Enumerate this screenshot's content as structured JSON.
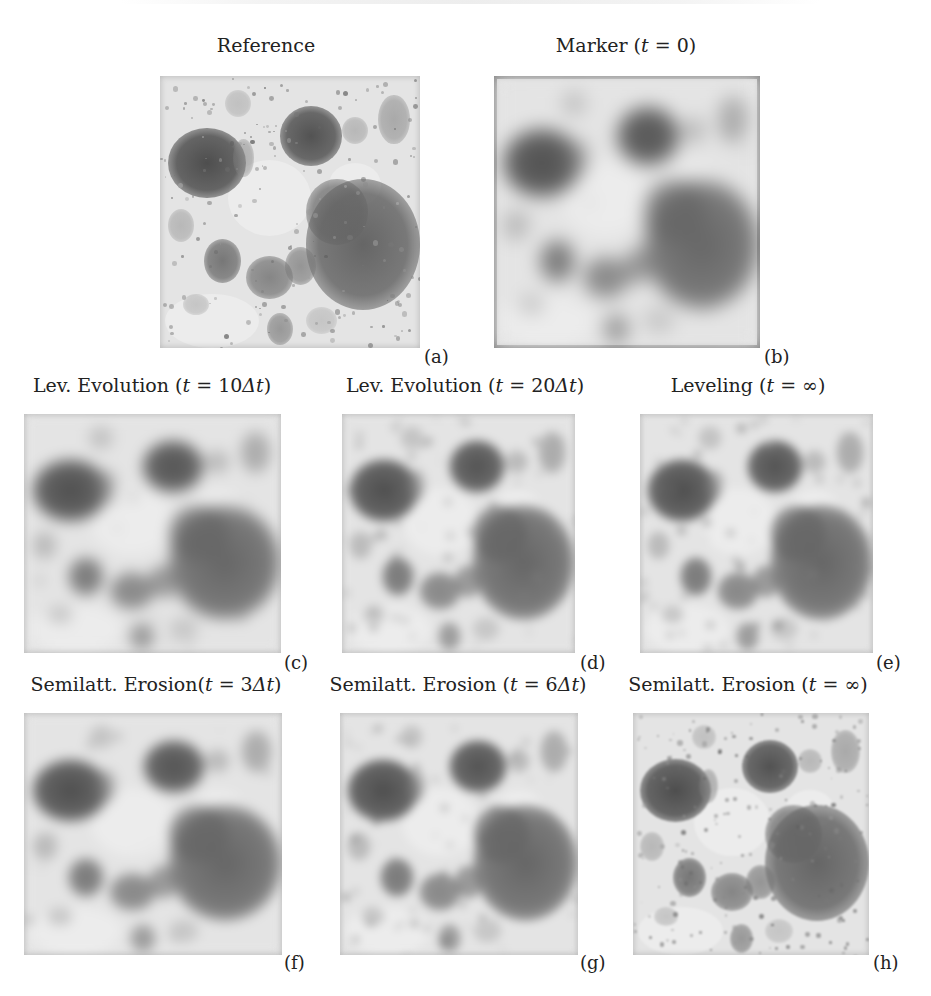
{
  "figure": {
    "panels": [
      {
        "id": "a",
        "title": "Reference",
        "label": "(a)",
        "x": 160,
        "y": 76,
        "w": 260,
        "h": 272,
        "blur": 0,
        "detail": "fine",
        "frame": false
      },
      {
        "id": "b",
        "title_parts": [
          "Marker (",
          "t",
          " = 0)"
        ],
        "title": "Marker (t = 0)",
        "label": "(b)",
        "x": 494,
        "y": 76,
        "w": 266,
        "h": 272,
        "blur": 9,
        "detail": "smooth",
        "frame": true
      },
      {
        "id": "c",
        "title": "Lev. Evolution (t = 10Δt)",
        "label": "(c)",
        "x": 24,
        "y": 414,
        "w": 257,
        "h": 239,
        "blur": 7,
        "detail": "smooth",
        "frame": false
      },
      {
        "id": "d",
        "title": "Lev. Evolution (t = 20Δt)",
        "label": "(d)",
        "x": 342,
        "y": 414,
        "w": 233,
        "h": 239,
        "blur": 5,
        "detail": "medium",
        "frame": false
      },
      {
        "id": "e",
        "title": "Leveling (t = ∞)",
        "label": "(e)",
        "x": 640,
        "y": 414,
        "w": 233,
        "h": 239,
        "blur": 4,
        "detail": "medium",
        "frame": false
      },
      {
        "id": "f",
        "title": "Semilatt. Erosion(t = 3Δt)",
        "label": "(f)",
        "x": 24,
        "y": 713,
        "w": 258,
        "h": 242,
        "blur": 6,
        "detail": "smooth",
        "frame": false
      },
      {
        "id": "g",
        "title": "Semilatt. Erosion (t = 6Δt)",
        "label": "(g)",
        "x": 340,
        "y": 713,
        "w": 238,
        "h": 242,
        "blur": 4,
        "detail": "medium",
        "frame": false
      },
      {
        "id": "h",
        "title": "Semilatt. Erosion (t = ∞)",
        "label": "(h)",
        "x": 633,
        "y": 713,
        "w": 236,
        "h": 242,
        "blur": 1,
        "detail": "fine",
        "frame": false
      }
    ],
    "titles": {
      "a": "Reference",
      "b": "Marker (t = 0)",
      "c": "Lev. Evolution (t = 10Δt)",
      "d": "Lev. Evolution (t = 20Δt)",
      "e": "Leveling (t = ∞)",
      "f": "Semilatt. Erosion(t = 3Δt)",
      "g": "Semilatt. Erosion (t = 6Δt)",
      "h": "Semilatt. Erosion (t = ∞)"
    },
    "labels": {
      "a": "(a)",
      "b": "(b)",
      "c": "(c)",
      "d": "(d)",
      "e": "(e)",
      "f": "(f)",
      "g": "(g)",
      "h": "(h)"
    },
    "colors": {
      "background": "#ffffff",
      "image_light": "#e8e8e8",
      "image_mid": "#a0a0a0",
      "image_dark": "#5e5e5e",
      "frame": "#8a8a8a",
      "text": "#222222"
    }
  }
}
